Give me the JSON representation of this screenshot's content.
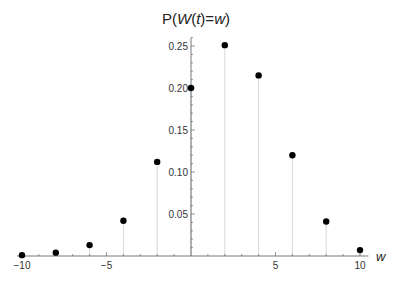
{
  "chart_data": {
    "type": "scatter",
    "style": "stem plot (points with vertical drop lines)",
    "title": "P(W(t)=w)",
    "xlabel": "w",
    "ylabel": "",
    "x": [
      -10,
      -8,
      -6,
      -4,
      -2,
      0,
      2,
      4,
      6,
      8,
      10
    ],
    "series": [
      {
        "name": "P(W(t)=w)",
        "values": [
          0.001,
          0.004,
          0.013,
          0.042,
          0.112,
          0.2,
          0.251,
          0.215,
          0.12,
          0.041,
          0.007
        ]
      }
    ],
    "xlim": [
      -10.3,
      10.5
    ],
    "ylim": [
      0,
      0.26
    ],
    "x_ticks": [
      -10,
      -5,
      5,
      10
    ],
    "x_tick_labels": [
      "−10",
      "−5",
      "5",
      "10"
    ],
    "y_ticks": [
      0.05,
      0.1,
      0.15,
      0.2,
      0.25
    ],
    "y_tick_labels": [
      "0.05",
      "0.10",
      "0.15",
      "0.20",
      "0.25"
    ],
    "grid": false,
    "legend": null,
    "colors": {
      "points": "#000000",
      "stems": "#d9d9d9",
      "axes": "#555555"
    }
  }
}
